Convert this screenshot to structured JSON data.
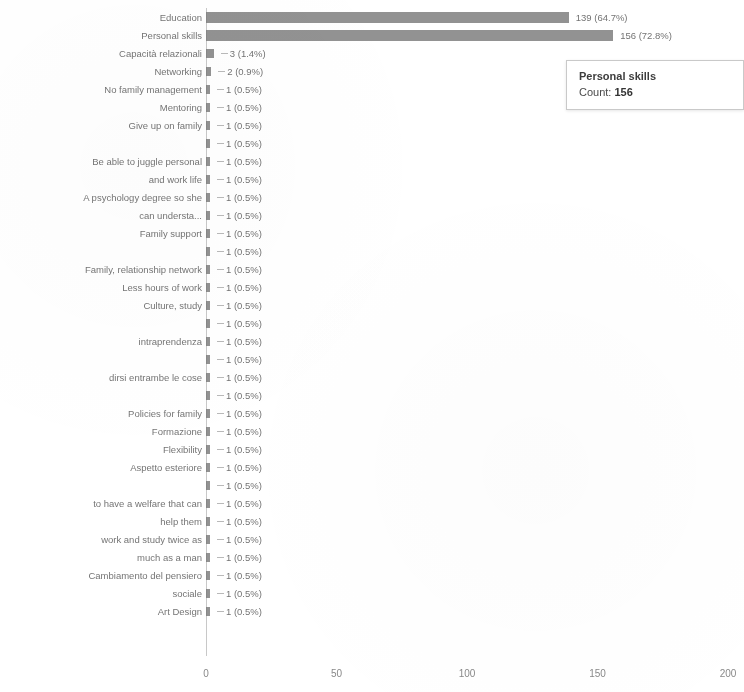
{
  "chart_data": {
    "type": "bar",
    "orientation": "horizontal",
    "title": "",
    "xlabel": "",
    "ylabel": "",
    "xlim": [
      0,
      200
    ],
    "xticks": [
      "0",
      "50",
      "100",
      "150",
      "200"
    ],
    "grid": false,
    "legend": "none",
    "categories": [
      "Education",
      "Personal skills",
      "Capacità relazionali",
      "Networking",
      "No family management",
      "Mentoring",
      "Give up on family",
      "",
      "Be able to juggle personal",
      "and work life",
      "A psychology degree so she",
      "can understa...",
      "Family support",
      "",
      "Family, relationship network",
      "Less hours of work",
      "Culture, study",
      "",
      "intraprendenza",
      "",
      "dirsi entrambe le cose",
      "",
      "Policies for family",
      "Formazione",
      "Flexibility",
      "Aspetto esteriore",
      "",
      "to have a welfare that can",
      "help them",
      "work and study twice as",
      "much as a man",
      "Cambiamento del pensiero",
      "sociale",
      "Art Design"
    ],
    "values": [
      139,
      156,
      3,
      2,
      1,
      1,
      1,
      1,
      1,
      1,
      1,
      1,
      1,
      1,
      1,
      1,
      1,
      1,
      1,
      1,
      1,
      1,
      1,
      1,
      1,
      1,
      1,
      1,
      1,
      1,
      1,
      1,
      1,
      1
    ],
    "value_labels": [
      "139 (64.7%)",
      "156 (72.8%)",
      "3 (1.4%)",
      "2 (0.9%)",
      "1 (0.5%)",
      "1 (0.5%)",
      "1 (0.5%)",
      "1 (0.5%)",
      "1 (0.5%)",
      "1 (0.5%)",
      "1 (0.5%)",
      "1 (0.5%)",
      "1 (0.5%)",
      "1 (0.5%)",
      "1 (0.5%)",
      "1 (0.5%)",
      "1 (0.5%)",
      "1 (0.5%)",
      "1 (0.5%)",
      "1 (0.5%)",
      "1 (0.5%)",
      "1 (0.5%)",
      "1 (0.5%)",
      "1 (0.5%)",
      "1 (0.5%)",
      "1 (0.5%)",
      "1 (0.5%)",
      "1 (0.5%)",
      "1 (0.5%)",
      "1 (0.5%)",
      "1 (0.5%)",
      "1 (0.5%)",
      "1 (0.5%)",
      "1 (0.5%)"
    ],
    "bar_color": "#777777"
  },
  "tooltip": {
    "title": "Personal skills",
    "count_label": "Count:",
    "count_value": "156"
  }
}
